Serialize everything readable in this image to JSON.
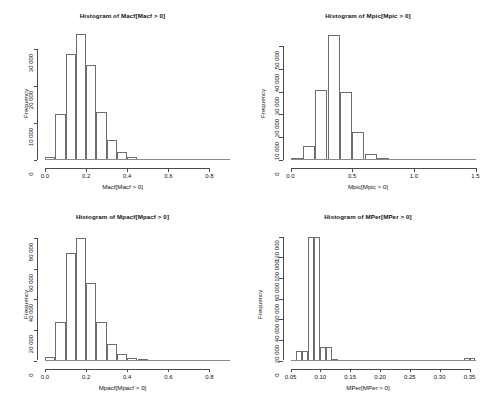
{
  "figure": {
    "background_color": "#ffffff",
    "axis_color": "#4a4a4a",
    "bar_outline_color": "#6e6e6e",
    "layout": "2x2 panel of histograms",
    "width": 491,
    "height": 401
  },
  "chart_data": [
    {
      "type": "bar",
      "subtype": "histogram",
      "panel": "top-left",
      "title": "Histogram of Macf[Macf > 0]",
      "xlabel": "Macf[Macf > 0]",
      "ylabel": "Frequency",
      "xlim": [
        0.0,
        0.9
      ],
      "ylim": [
        0,
        35000
      ],
      "xticks": [
        0.0,
        0.2,
        0.4,
        0.6,
        0.8
      ],
      "xticklabels": [
        "0.0",
        "0.2",
        "0.4",
        "0.6",
        "0.8"
      ],
      "yticks": [
        0,
        10000,
        20000,
        30000
      ],
      "yticklabels": [
        "0",
        "10 000",
        "20 000",
        "30 000"
      ],
      "grid": false,
      "legend": false,
      "bin_width": 0.05,
      "bin_edges": [
        0.0,
        0.05,
        0.1,
        0.15,
        0.2,
        0.25,
        0.3,
        0.35,
        0.4,
        0.45,
        0.5,
        0.55,
        0.6,
        0.65,
        0.7,
        0.75,
        0.8,
        0.85,
        0.9
      ],
      "values": [
        900,
        12500,
        28500,
        34000,
        25500,
        13000,
        5500,
        2200,
        800,
        300,
        150,
        90,
        60,
        40,
        25,
        15,
        10,
        5
      ]
    },
    {
      "type": "bar",
      "subtype": "histogram",
      "panel": "top-right",
      "title": "Histogram of Mpic[Mpic > 0]",
      "xlabel": "Mpic[Mpic > 0]",
      "ylabel": "Frequency",
      "xlim": [
        0.0,
        1.5
      ],
      "ylim": [
        0,
        57000
      ],
      "xticks": [
        0.0,
        0.5,
        1.0,
        1.5
      ],
      "xticklabels": [
        "0.0",
        "0.5",
        "1.0",
        "1.5"
      ],
      "yticks": [
        0,
        10000,
        20000,
        30000,
        40000,
        50000
      ],
      "yticklabels": [
        "0",
        "10 000",
        "20 000",
        "30 000",
        "40 000",
        "50 000"
      ],
      "grid": false,
      "legend": false,
      "bin_width": 0.1,
      "bin_edges": [
        0.0,
        0.1,
        0.2,
        0.3,
        0.4,
        0.5,
        0.6,
        0.7,
        0.8,
        0.9,
        1.0,
        1.1,
        1.2,
        1.3,
        1.4,
        1.5
      ],
      "values": [
        700,
        6000,
        30500,
        55000,
        30000,
        12500,
        2500,
        700,
        300,
        200,
        150,
        250,
        150,
        100,
        60
      ]
    },
    {
      "type": "bar",
      "subtype": "histogram",
      "panel": "bottom-left",
      "title": "Histogram of Mpacf[Mpacf > 0]",
      "xlabel": "Mpacf[Mpacf > 0]",
      "ylabel": "Frequency",
      "xlim": [
        0.0,
        0.9
      ],
      "ylim": [
        0,
        85000
      ],
      "xticks": [
        0.0,
        0.2,
        0.4,
        0.6,
        0.8
      ],
      "xticklabels": [
        "0.0",
        "0.2",
        "0.4",
        "0.6",
        "0.8"
      ],
      "yticks": [
        0,
        20000,
        40000,
        60000,
        80000
      ],
      "yticklabels": [
        "0",
        "20 000",
        "40 000",
        "60 000",
        "80 000"
      ],
      "grid": false,
      "legend": false,
      "bin_width": 0.05,
      "bin_edges": [
        0.0,
        0.05,
        0.1,
        0.15,
        0.2,
        0.25,
        0.3,
        0.35,
        0.4,
        0.45,
        0.5,
        0.55,
        0.6,
        0.65,
        0.7,
        0.75,
        0.8,
        0.85,
        0.9
      ],
      "values": [
        2000,
        25000,
        70000,
        80000,
        51000,
        25000,
        11000,
        4500,
        1800,
        700,
        300,
        150,
        100,
        60,
        40,
        25,
        15,
        10
      ]
    },
    {
      "type": "bar",
      "subtype": "histogram",
      "panel": "bottom-right",
      "title": "Histogram of MPer[MPer > 0]",
      "xlabel": "MPer[MPer > 0]",
      "ylabel": "Frequency",
      "xlim": [
        0.05,
        0.36
      ],
      "ylim": [
        0,
        126000
      ],
      "xticks": [
        0.05,
        0.1,
        0.15,
        0.2,
        0.25,
        0.3,
        0.35
      ],
      "xticklabels": [
        "0.05",
        "0.10",
        "0.15",
        "0.20",
        "0.25",
        "0.30",
        "0.35"
      ],
      "yticks": [
        0,
        20000,
        40000,
        60000,
        80000,
        100000,
        120000
      ],
      "yticklabels": [
        "0",
        "20 000",
        "40 000",
        "60 000",
        "80 000",
        "100 000",
        "120 000"
      ],
      "grid": false,
      "legend": false,
      "bin_width": 0.01,
      "bin_edges": [
        0.05,
        0.06,
        0.07,
        0.08,
        0.09,
        0.1,
        0.11,
        0.12,
        0.13,
        0.14,
        0.15,
        0.16,
        0.17,
        0.18,
        0.19,
        0.2,
        0.21,
        0.22,
        0.23,
        0.24,
        0.25,
        0.26,
        0.27,
        0.28,
        0.29,
        0.3,
        0.31,
        0.32,
        0.33,
        0.34,
        0.35,
        0.36
      ],
      "values": [
        300,
        9000,
        9000,
        120000,
        120000,
        13000,
        13000,
        1200,
        400,
        250,
        180,
        150,
        120,
        100,
        90,
        80,
        70,
        60,
        55,
        50,
        45,
        40,
        38,
        35,
        30,
        28,
        25,
        22,
        20,
        2500,
        2500
      ]
    }
  ]
}
